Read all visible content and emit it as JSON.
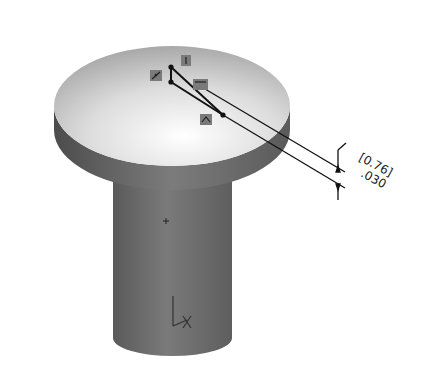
{
  "viewport": {
    "description": "3D CAD part: flat-head pin with sketch triangle on top face"
  },
  "dimension": {
    "metric_value": "[0.76]",
    "imperial_value": ".030"
  },
  "sketch_relations": [
    {
      "name": "vertical-relation",
      "glyph": "|"
    },
    {
      "name": "coincident-relation",
      "glyph": "⟋"
    },
    {
      "name": "horizontal-relation",
      "glyph": "—"
    },
    {
      "name": "midpoint-relation",
      "glyph": "⊼"
    }
  ],
  "colors": {
    "disc_top_light": "#f4f4f4",
    "disc_top_dark": "#a8a8a8",
    "rim": "#6e6e6e",
    "cylinder": "#6a6a6a",
    "sketch_line": "#111111",
    "relation_box": "#7a7a7a"
  }
}
